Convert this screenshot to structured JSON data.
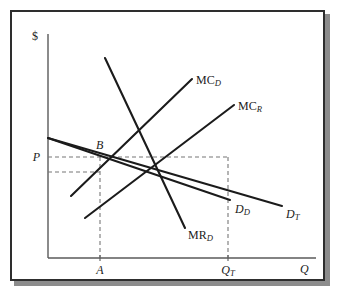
{
  "figure": {
    "type": "economics-supply-demand-diagram",
    "frame_color": "#2e2e2e",
    "shadow_color": "#8c8c8c",
    "background": "#ffffff",
    "line_color": "#1b1b1b",
    "dash_color": "#777777"
  },
  "axes": {
    "y_axis_label": "$",
    "x_axis_label": "Q",
    "y_axis_x": 48,
    "x_axis_y": 258,
    "origin": {
      "x": 48,
      "y": 258
    }
  },
  "axis_ticks": {
    "x": [
      {
        "label": "A",
        "sub": "",
        "x": 100
      },
      {
        "label": "Q",
        "sub": "T",
        "x": 228
      }
    ],
    "y": [
      {
        "label": "P",
        "sub": "",
        "y": 157
      }
    ]
  },
  "points": [
    {
      "name": "B",
      "label": "B",
      "x": 100,
      "y": 157
    }
  ],
  "curve_labels": [
    {
      "name": "mc-d",
      "base": "MC",
      "sub": "D",
      "x": 196,
      "y": 74,
      "style": "roman"
    },
    {
      "name": "mc-r",
      "base": "MC",
      "sub": "R",
      "x": 238,
      "y": 100,
      "style": "roman"
    },
    {
      "name": "d-d",
      "base": "D",
      "sub": "D",
      "x": 235,
      "y": 203,
      "style": "ital"
    },
    {
      "name": "d-t",
      "base": "D",
      "sub": "T",
      "x": 286,
      "y": 208,
      "style": "ital"
    },
    {
      "name": "mr-d",
      "base": "MR",
      "sub": "D",
      "x": 188,
      "y": 229,
      "style": "roman"
    }
  ],
  "chart_data": {
    "type": "line",
    "title": "",
    "xlabel": "Q",
    "ylabel": "$",
    "grid": false,
    "legend": "inline-curve-labels",
    "xlim": [
      48,
      318
    ],
    "ylim": [
      258,
      30
    ],
    "series": [
      {
        "name": "MR_D",
        "label_base": "MR",
        "label_sub": "D",
        "points": [
          [
            105,
            58
          ],
          [
            185,
            228
          ]
        ]
      },
      {
        "name": "MC_D",
        "label_base": "MC",
        "label_sub": "D",
        "points": [
          [
            71,
            196
          ],
          [
            192,
            79
          ]
        ]
      },
      {
        "name": "MC_R",
        "label_base": "MC",
        "label_sub": "R",
        "points": [
          [
            85,
            218
          ],
          [
            234,
            105
          ]
        ]
      },
      {
        "name": "D_D",
        "label_base": "D",
        "label_sub": "D",
        "points": [
          [
            48,
            138
          ],
          [
            230,
            200
          ]
        ]
      },
      {
        "name": "D_T",
        "label_base": "D",
        "label_sub": "T",
        "points": [
          [
            48,
            138
          ],
          [
            282,
            206
          ]
        ]
      }
    ],
    "guide_lines": [
      {
        "name": "price-horizontal",
        "orientation": "horizontal",
        "from": [
          48,
          157
        ],
        "to": [
          228,
          157
        ]
      },
      {
        "name": "lower-horizontal",
        "orientation": "horizontal",
        "from": [
          48,
          172
        ],
        "to": [
          100,
          172
        ]
      },
      {
        "name": "quantity-a-vertical",
        "orientation": "vertical",
        "from": [
          100,
          157
        ],
        "to": [
          100,
          258
        ]
      },
      {
        "name": "quantity-t-vertical",
        "orientation": "vertical",
        "from": [
          228,
          157
        ],
        "to": [
          228,
          258
        ]
      }
    ],
    "annotations": [
      {
        "text": "B",
        "x": 100,
        "y": 157,
        "note": "intersection point on price line"
      },
      {
        "text": "P",
        "x": 48,
        "y": 157,
        "note": "price level on y-axis"
      },
      {
        "text": "A",
        "x": 100,
        "y": 258,
        "note": "quantity A on x-axis"
      },
      {
        "text": "Q_T",
        "x": 228,
        "y": 258,
        "note": "total quantity on x-axis"
      }
    ]
  }
}
